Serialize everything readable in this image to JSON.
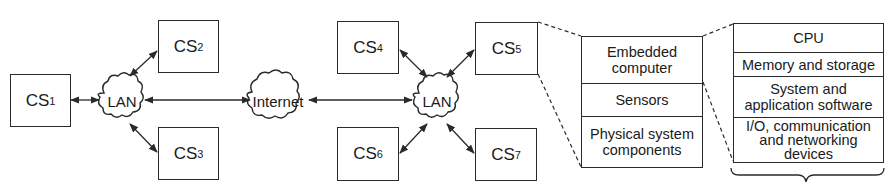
{
  "diagram": {
    "type": "network-architecture",
    "systems": [
      {
        "id": "cs1",
        "label": "CS",
        "sub": "1"
      },
      {
        "id": "cs2",
        "label": "CS",
        "sub": "2"
      },
      {
        "id": "cs3",
        "label": "CS",
        "sub": "3"
      },
      {
        "id": "cs4",
        "label": "CS",
        "sub": "4"
      },
      {
        "id": "cs5",
        "label": "CS",
        "sub": "5"
      },
      {
        "id": "cs6",
        "label": "CS",
        "sub": "6"
      },
      {
        "id": "cs7",
        "label": "CS",
        "sub": "7"
      }
    ],
    "networks": {
      "lan_left": "LAN",
      "internet": "Internet",
      "lan_right": "LAN"
    },
    "embedded_stack": [
      "Embedded computer",
      "Sensors",
      "Physical system components"
    ],
    "computer_stack": [
      "CPU",
      "Memory and storage",
      "System and application software",
      "I/O, communication and networking devices"
    ],
    "connections": [
      {
        "from": "cs1",
        "to": "lan_left",
        "bidirectional": true
      },
      {
        "from": "cs2",
        "to": "lan_left",
        "bidirectional": true
      },
      {
        "from": "cs3",
        "to": "lan_left",
        "bidirectional": true
      },
      {
        "from": "lan_left",
        "to": "internet",
        "bidirectional": true
      },
      {
        "from": "internet",
        "to": "lan_right",
        "bidirectional": true
      },
      {
        "from": "cs4",
        "to": "lan_right",
        "bidirectional": true
      },
      {
        "from": "cs5",
        "to": "lan_right",
        "bidirectional": true
      },
      {
        "from": "cs6",
        "to": "lan_right",
        "bidirectional": true
      },
      {
        "from": "cs7",
        "to": "lan_right",
        "bidirectional": true
      }
    ],
    "expansions": [
      {
        "from": "cs5",
        "to": "embedded_stack",
        "style": "dashed"
      },
      {
        "from": "embedded_stack.Embedded computer",
        "to": "computer_stack",
        "style": "dashed"
      }
    ]
  },
  "colors": {
    "line": "#2a2a2a",
    "background": "#ffffff"
  }
}
